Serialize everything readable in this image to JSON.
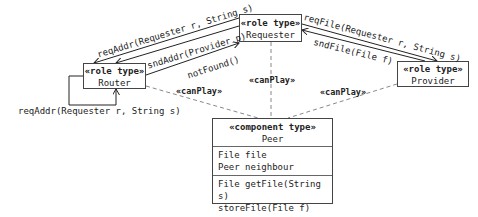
{
  "roles": {
    "router": {
      "stereotype": "«role type»",
      "name": "Router"
    },
    "requester": {
      "stereotype": "«role type»",
      "name": "Requester"
    },
    "provider": {
      "stereotype": "«role type»",
      "name": "Provider"
    }
  },
  "component": {
    "stereotype": "«component type»",
    "name": "Peer",
    "attributes": [
      "File file",
      "Peer neighbour"
    ],
    "operations": [
      "File getFile(String s)",
      "storeFile(File f)"
    ]
  },
  "messages": {
    "req_addr_top": "reqAddr(Requester r, String s)",
    "snd_addr": "sndAddr(Provider p)",
    "not_found": "notFound()",
    "req_file": "reqFile(Requester r, String s)",
    "snd_file": "sndFile(File f)",
    "req_addr_self": "reqAddr(Requester r, String s)"
  },
  "can_play": {
    "router": "«canPlay»",
    "requester": "«canPlay»",
    "provider": "«canPlay»"
  }
}
